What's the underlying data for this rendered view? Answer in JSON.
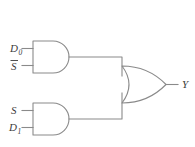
{
  "diagram": {
    "colors": {
      "background": "#ffffff",
      "line": "#8a8a8a",
      "text": "#3b3b3b"
    },
    "gates": [
      {
        "id": "and-gate-top",
        "type": "AND",
        "inputs": [
          "D0",
          "Sbar"
        ],
        "output": "and-top-out"
      },
      {
        "id": "and-gate-bottom",
        "type": "AND",
        "inputs": [
          "S",
          "D1"
        ],
        "output": "and-bottom-out"
      },
      {
        "id": "or-gate",
        "type": "OR",
        "inputs": [
          "and-top-out",
          "and-bottom-out"
        ],
        "output": "Y"
      }
    ],
    "labels": {
      "input_d0": "D",
      "input_d0_sub": "0",
      "input_sbar": "S",
      "input_s": "S",
      "input_d1": "D",
      "input_d1_sub": "1",
      "output_y": "Y"
    }
  }
}
